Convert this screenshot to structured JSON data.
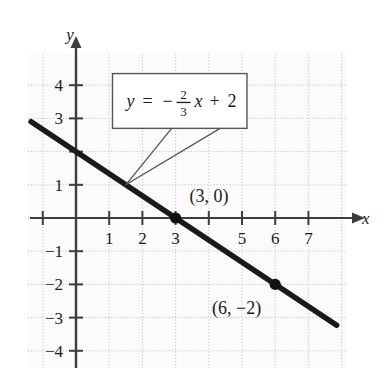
{
  "chart_data": {
    "type": "line",
    "title": "",
    "subtitle": "",
    "xlabel": "x",
    "ylabel": "y",
    "equation_label": "y = -2/3 x + 2",
    "equation_parts": {
      "lhs": "y",
      "equals": "=",
      "minus": "−",
      "numerator": "2",
      "denominator": "3",
      "variable": "x",
      "plus": "+",
      "intercept": "2"
    },
    "slope": -0.6666666667,
    "y_intercept": 2,
    "xlim": [
      -1.45,
      8.4
    ],
    "ylim": [
      -4.85,
      5.0
    ],
    "grid": true,
    "grid_style": "dotted",
    "legend": "none",
    "x_ticks": [
      -1,
      1,
      2,
      3,
      4,
      5,
      6,
      7
    ],
    "x_tick_labels": [
      "",
      "1",
      "2",
      "3",
      "",
      "5",
      "6",
      "7"
    ],
    "y_ticks": [
      4,
      3,
      2,
      1,
      -1,
      -2,
      -3,
      -4
    ],
    "y_tick_labels": [
      "4",
      "3",
      "",
      "1",
      "−1",
      "−2",
      "−3",
      "−4"
    ],
    "line_endpoints": [
      {
        "x": -1.35,
        "y": 2.9
      },
      {
        "x": 7.85,
        "y": -3.23
      }
    ],
    "points": [
      {
        "x": 3,
        "y": 0,
        "label": "(3, 0)",
        "marker": "filled-circle"
      },
      {
        "x": 6,
        "y": -2,
        "label": "(6, −2)",
        "marker": "filled-circle"
      }
    ],
    "annotation": {
      "text": "y = -2/3 x + 2",
      "box": {
        "x_left": 1.1,
        "x_right": 5.15,
        "y_top": 4.35,
        "y_bottom": 2.7
      },
      "leader_targets": [
        {
          "x": 1.5,
          "y": 1.0
        },
        {
          "x": 1.5,
          "y": 1.0
        }
      ]
    },
    "colors": {
      "line": "#1a1a1a",
      "axis": "#3d3d3d",
      "grid": "#b9b9b9",
      "background": "#fbfbfb",
      "point": "#111111",
      "callout_border": "#555555",
      "callout_fill": "#ffffff",
      "text": "#1a1a1a"
    }
  }
}
